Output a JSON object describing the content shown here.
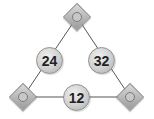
{
  "diagram": {
    "type": "number-triangle",
    "vertices": [
      {
        "position": "top",
        "icon": "blank-circle-icon",
        "glyph": ""
      },
      {
        "position": "bottom-left",
        "icon": "blank-circle-icon",
        "glyph": ""
      },
      {
        "position": "bottom-right",
        "icon": "blank-circle-icon",
        "glyph": ""
      }
    ],
    "edges": [
      {
        "side": "left",
        "value": "24"
      },
      {
        "side": "right",
        "value": "32"
      },
      {
        "side": "bottom",
        "value": "12"
      }
    ],
    "colors": {
      "line": "#555555",
      "shape_fill": "#c4c4c4",
      "text": "#222222"
    }
  }
}
